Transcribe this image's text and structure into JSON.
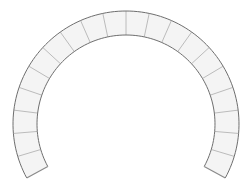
{
  "diagram": {
    "type": "horseshoe-arch",
    "colors": {
      "background": "#ffffff",
      "block_fill": "#f4f4f4",
      "outline": "#6e6e6e",
      "joint": "#b4b4b4",
      "base": "#8a8a8a"
    },
    "geometry": {
      "center_x": 126,
      "center_y": 124,
      "outer_radius": 113,
      "inner_radius": 89,
      "start_angle_deg": 208.5,
      "end_angle_deg": -28.5,
      "block_count": 20
    }
  }
}
